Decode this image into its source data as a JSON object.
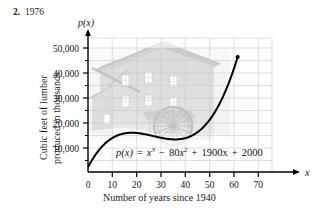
{
  "header": {
    "exercise_number": "2.",
    "answer": "1976"
  },
  "chart_data": {
    "type": "line",
    "title": "",
    "subtitle": "",
    "equation": "p(x) = x^3 - 80x^2 + 1900x + 2000",
    "equation_parts": {
      "lhs": "p(x)",
      "eq": "=",
      "t1_base": "x",
      "t1_exp": "3",
      "minus": "−",
      "t2_coef": "80",
      "t2_base": "x",
      "t2_exp": "2",
      "plus1": "+",
      "t3": "1900x",
      "plus2": "+",
      "t4": "2000"
    },
    "xlabel": "Number of years since 1940",
    "ylabel_line1": "Cubic feet of lumber",
    "ylabel_line2": "produced in thousands",
    "y_axis_name": "p(x)",
    "x_axis_name": "x",
    "xlim": [
      0,
      75
    ],
    "ylim": [
      0,
      55000
    ],
    "x_ticks": [
      0,
      10,
      20,
      30,
      40,
      50,
      60,
      70
    ],
    "x_tick_labels": [
      "0",
      "10",
      "20",
      "30",
      "40",
      "50",
      "60",
      "70"
    ],
    "y_ticks": [
      10000,
      20000,
      30000,
      40000,
      50000
    ],
    "y_tick_labels": [
      "10,000",
      "20,000",
      "30,000",
      "40,000",
      "50,000"
    ],
    "y_minor_ticks": [
      5000,
      15000,
      25000,
      35000,
      45000
    ],
    "grid": true,
    "grid_color": "#c9c9c9",
    "curve_color": "#000000",
    "domain_plotted": [
      0,
      61
    ],
    "endpoint_marker": {
      "x": 61,
      "y": 49161
    },
    "points": [
      {
        "x": 0,
        "y": 2000
      },
      {
        "x": 5,
        "y": 9625
      },
      {
        "x": 10,
        "y": 14000
      },
      {
        "x": 15,
        "y": 15875
      },
      {
        "x": 18,
        "y": 16112
      },
      {
        "x": 20,
        "y": 16000
      },
      {
        "x": 25,
        "y": 14875
      },
      {
        "x": 30,
        "y": 14000
      },
      {
        "x": 35,
        "y": 13625
      },
      {
        "x": 36,
        "y": 13616
      },
      {
        "x": 40,
        "y": 14000
      },
      {
        "x": 45,
        "y": 16375
      },
      {
        "x": 50,
        "y": 22000
      },
      {
        "x": 55,
        "y": 31875
      },
      {
        "x": 60,
        "y": 44000
      },
      {
        "x": 61,
        "y": 46861
      }
    ],
    "legend": [],
    "annotations": [
      {
        "name": "background-photo",
        "description": "faded grayscale photo of an old lumber mill building with a water wheel"
      }
    ]
  }
}
